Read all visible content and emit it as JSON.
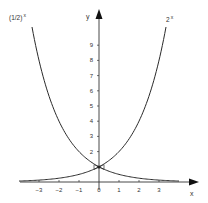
{
  "chart_data": {
    "type": "line",
    "title": "",
    "xlabel": "x",
    "ylabel": "y",
    "xlim": [
      -4,
      5
    ],
    "ylim": [
      0,
      10.5
    ],
    "grid": false,
    "legend_position": "none",
    "x_ticks": [
      -3,
      -2,
      -1,
      0,
      1,
      2,
      3
    ],
    "x_tick_labels": [
      "−3",
      "−2",
      "−1",
      "0",
      "1",
      "2",
      "3"
    ],
    "y_ticks": [
      1,
      2,
      3,
      4,
      5,
      6,
      7,
      8,
      9
    ],
    "y_tick_labels": [
      "",
      "2",
      "3",
      "4",
      "5",
      "6",
      "7",
      "8",
      "9"
    ],
    "series": [
      {
        "name": "(1/2)^x",
        "label_base": "(1/2)",
        "label_exp": "x",
        "x": [
          -3.35,
          -3,
          -2.5,
          -2,
          -1.5,
          -1,
          -0.5,
          0,
          0.5,
          1,
          1.5,
          2,
          2.5,
          3,
          3.5,
          4
        ],
        "values": [
          10.2,
          8,
          5.66,
          4,
          2.83,
          2,
          1.41,
          1,
          0.71,
          0.5,
          0.35,
          0.25,
          0.18,
          0.125,
          0.09,
          0.0625
        ]
      },
      {
        "name": "2^x",
        "label_base": "2",
        "label_exp": "x",
        "x": [
          -4,
          -3.5,
          -3,
          -2.5,
          -2,
          -1.5,
          -1,
          -0.5,
          0,
          0.5,
          1,
          1.5,
          2,
          2.5,
          3,
          3.35
        ],
        "values": [
          0.0625,
          0.09,
          0.125,
          0.18,
          0.25,
          0.35,
          0.5,
          0.71,
          1,
          1.41,
          2,
          2.83,
          4,
          5.66,
          8,
          10.2
        ]
      }
    ],
    "annotations": [
      {
        "type": "marker",
        "x": 0,
        "y": 1,
        "description": "intersection point"
      }
    ]
  },
  "colors": {
    "axis": "#333333",
    "curve": "#2a2a2a",
    "text": "#333333"
  }
}
